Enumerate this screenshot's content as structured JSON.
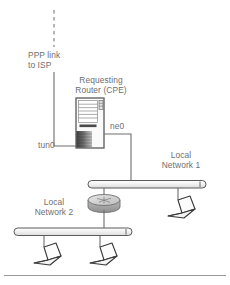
{
  "diagram": {
    "labels": {
      "ppp_link": "PPP link\nto ISP",
      "router_title": "Requesting\nRouter (CPE)",
      "interface_tun0": "tun0",
      "interface_ne0": "ne0",
      "local_network_1": "Local\nNetwork 1",
      "local_network_2": "Local\nNetwork 2"
    },
    "nodes": [
      {
        "id": "isp-uplink",
        "type": "dashed-line",
        "label": "PPP link to ISP"
      },
      {
        "id": "cpe-router",
        "type": "server-tower",
        "label": "Requesting Router (CPE)"
      },
      {
        "id": "hub",
        "type": "router-puck",
        "label": ""
      },
      {
        "id": "net-bar-1",
        "type": "network-segment",
        "label": "Local Network 1"
      },
      {
        "id": "net-bar-2",
        "type": "network-segment",
        "label": "Local Network 2"
      },
      {
        "id": "laptop-net1",
        "type": "laptop",
        "label": ""
      },
      {
        "id": "laptop-net2-a",
        "type": "laptop",
        "label": ""
      },
      {
        "id": "laptop-net2-b",
        "type": "laptop",
        "label": ""
      }
    ],
    "links": [
      {
        "from": "isp-uplink",
        "to": "cpe-router",
        "interface": "tun0"
      },
      {
        "from": "cpe-router",
        "to": "net-bar-1",
        "interface": "ne0"
      },
      {
        "from": "net-bar-1",
        "to": "hub",
        "interface": ""
      },
      {
        "from": "hub",
        "to": "net-bar-2",
        "interface": ""
      },
      {
        "from": "net-bar-1",
        "to": "laptop-net1",
        "interface": ""
      },
      {
        "from": "net-bar-2",
        "to": "laptop-net2-a",
        "interface": ""
      },
      {
        "from": "net-bar-2",
        "to": "laptop-net2-b",
        "interface": ""
      }
    ],
    "colors": {
      "line": "#6e6e6e",
      "text": "#6e6e6e",
      "bar_fill": "#f2f2f2",
      "bar_stroke": "#5a5a5a",
      "router_body": "#f7f7f7",
      "router_shade_dark": "#3c3c3c",
      "router_shade_light": "#b8b8b8",
      "hub_top": "#d8d8d8",
      "hub_side": "#a8a8a8",
      "laptop_fill": "#fbfbfb",
      "laptop_stroke": "#3a3a3a",
      "footer_rule": "#9a9a9a",
      "page_bg": "#ffffff"
    }
  }
}
